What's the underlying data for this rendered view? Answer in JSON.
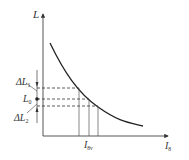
{
  "diagram": {
    "y_axis_label": "L",
    "x_axis_label": "I",
    "x_axis_label_sub": "8",
    "delta_upper_label": "ΔL",
    "delta_upper_sub": "1",
    "center_label": "L",
    "center_sub": "0",
    "delta_lower_label": "ΔL",
    "delta_lower_sub": "2",
    "x_tick_label": "I",
    "x_tick_sub": "8v",
    "curve_description": "decreasing convex curve of L versus I",
    "colors": {
      "line": "#333333",
      "background": "#ffffff"
    }
  }
}
